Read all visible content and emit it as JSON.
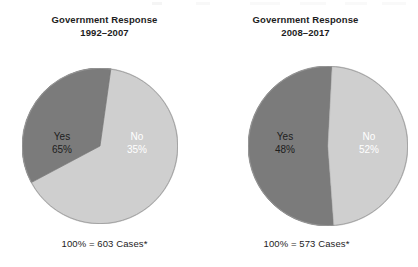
{
  "figure": {
    "width": 418,
    "height": 267,
    "background": "#ffffff"
  },
  "colors": {
    "slice_yes": "#cfcfcf",
    "slice_no": "#7b7b7b",
    "outline": "#8a8a8a",
    "text_dark": "#1d1d1d",
    "text_light": "#ffffff"
  },
  "panels": [
    {
      "title_line1": "Government Response",
      "title_line2": "1992–2007",
      "footnote": "100% = 603 Cases*",
      "slices": [
        {
          "label": "Yes",
          "pct_text": "65%",
          "value": 65,
          "color": "#cfcfcf",
          "label_color": "dark"
        },
        {
          "label": "No",
          "pct_text": "35%",
          "value": 35,
          "color": "#7b7b7b",
          "label_color": "light"
        }
      ]
    },
    {
      "title_line1": "Government Response",
      "title_line2": "2008–2017",
      "footnote": "100% = 573 Cases*",
      "slices": [
        {
          "label": "Yes",
          "pct_text": "48%",
          "value": 48,
          "color": "#cfcfcf",
          "label_color": "dark"
        },
        {
          "label": "No",
          "pct_text": "52%",
          "value": 52,
          "color": "#7b7b7b",
          "label_color": "light"
        }
      ]
    }
  ],
  "chart_data": [
    {
      "type": "pie",
      "title": "Government Response 1992–2007",
      "categories": [
        "Yes",
        "No"
      ],
      "values": [
        65,
        35
      ],
      "value_labels": [
        "65%",
        "35%"
      ],
      "total_label": "100% = 603 Cases*",
      "total_cases": 603,
      "colors": [
        "#cfcfcf",
        "#7b7b7b"
      ],
      "start_angle_deg": 8,
      "direction": "clockwise",
      "legend": "none",
      "grid": false,
      "labels_inside": true
    },
    {
      "type": "pie",
      "title": "Government Response 2008–2017",
      "categories": [
        "Yes",
        "No"
      ],
      "values": [
        48,
        52
      ],
      "value_labels": [
        "48%",
        "52%"
      ],
      "total_label": "100% = 573 Cases*",
      "total_cases": 573,
      "colors": [
        "#cfcfcf",
        "#7b7b7b"
      ],
      "start_angle_deg": 3,
      "direction": "clockwise",
      "legend": "none",
      "grid": false,
      "labels_inside": true
    }
  ]
}
